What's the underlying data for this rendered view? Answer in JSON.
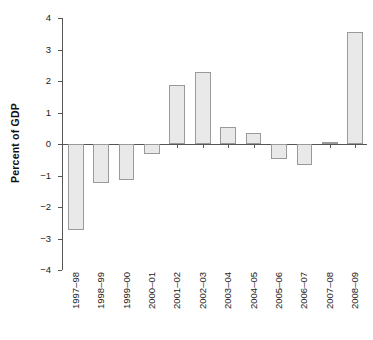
{
  "chart_data": {
    "type": "bar",
    "title": "",
    "xlabel": "",
    "ylabel": "Percent of GDP",
    "ylim": [
      -4,
      4
    ],
    "yticks": [
      4,
      3,
      2,
      1,
      0,
      -1,
      -2,
      -3,
      -4
    ],
    "ytick_labels": [
      "4",
      "3",
      "2",
      "1",
      "0",
      "−1",
      "−2",
      "−3",
      "−4"
    ],
    "grid": false,
    "legend": null,
    "bar_fill_color": "#e9e9e9",
    "bar_edge_color": "#9a9a9a",
    "axis_color": "#555555",
    "categories": [
      "1997–98",
      "1998–99",
      "1999–00",
      "2000–01",
      "2001–02",
      "2002–03",
      "2003–04",
      "2004–05",
      "2005–06",
      "2006–07",
      "2007–08",
      "2008–09"
    ],
    "values": [
      -2.73,
      -1.25,
      -1.15,
      -0.32,
      1.87,
      2.3,
      0.55,
      0.35,
      -0.47,
      -0.67,
      0.05,
      3.55
    ]
  }
}
